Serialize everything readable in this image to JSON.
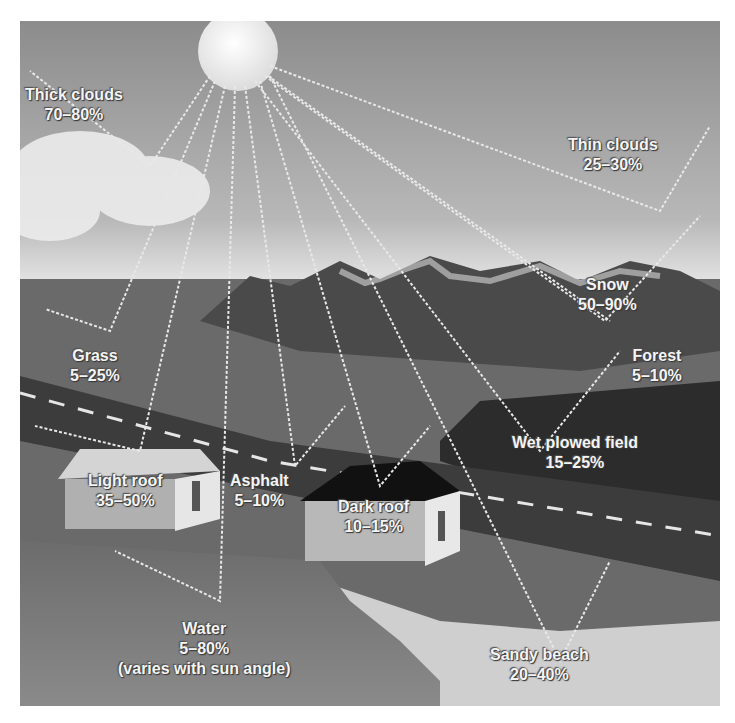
{
  "diagram": {
    "colors": {
      "sky_top": "#8a8a8a",
      "sky_bottom": "#d8d8d8",
      "ground": "#6e6e6e",
      "field": "#2e2e2e",
      "water": "#7c7c7c",
      "sun": "#f2f2f2",
      "label_text": "#f4f4f4"
    },
    "labels": [
      {
        "id": "thick-clouds",
        "name": "Thick clouds",
        "value": "70–80%"
      },
      {
        "id": "thin-clouds",
        "name": "Thin clouds",
        "value": "25–30%"
      },
      {
        "id": "snow",
        "name": "Snow",
        "value": "50–90%"
      },
      {
        "id": "grass",
        "name": "Grass",
        "value": "5–25%"
      },
      {
        "id": "forest",
        "name": "Forest",
        "value": "5–10%"
      },
      {
        "id": "wet-plowed-field",
        "name": "Wet plowed field",
        "value": "15–25%"
      },
      {
        "id": "light-roof",
        "name": "Light roof",
        "value": "35–50%"
      },
      {
        "id": "asphalt",
        "name": "Asphalt",
        "value": "5–10%"
      },
      {
        "id": "dark-roof",
        "name": "Dark roof",
        "value": "10–15%"
      },
      {
        "id": "water",
        "name": "Water",
        "value": "5–80%",
        "note": "(varies with sun angle)"
      },
      {
        "id": "sandy-beach",
        "name": "Sandy beach",
        "value": "20–40%"
      }
    ]
  }
}
